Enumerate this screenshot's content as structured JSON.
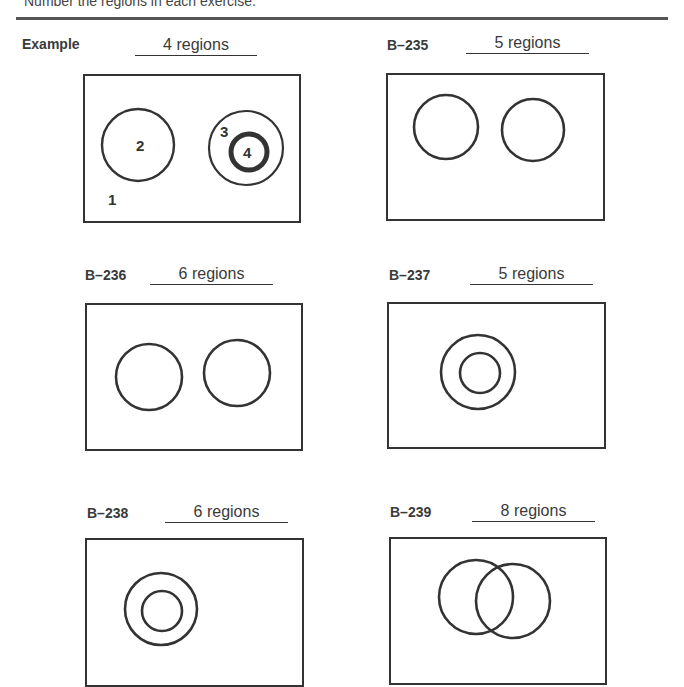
{
  "instructions": "Number the regions in each exercise.",
  "exercises": [
    {
      "id": "example",
      "label": "Example",
      "answer": "4 regions",
      "region_numbers": [
        "1",
        "2",
        "3",
        "4"
      ]
    },
    {
      "id": "b235",
      "label": "B–235",
      "answer": "5 regions"
    },
    {
      "id": "b236",
      "label": "B–236",
      "answer": "6 regions"
    },
    {
      "id": "b237",
      "label": "B–237",
      "answer": "5 regions"
    },
    {
      "id": "b238",
      "label": "B–238",
      "answer": "6 regions"
    },
    {
      "id": "b239",
      "label": "B–239",
      "answer": "8 regions"
    }
  ],
  "colors": {
    "ink": "#333333",
    "rule": "#555555"
  }
}
